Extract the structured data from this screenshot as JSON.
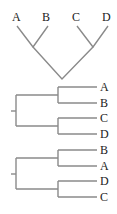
{
  "header_fragment": "图 1 数据",
  "trees": [
    {
      "id": "tree-v",
      "orientation": "vertical",
      "leaves": [
        "A",
        "B",
        "C",
        "D"
      ],
      "topology": "((A,B),(C,D))"
    },
    {
      "id": "tree-h1",
      "orientation": "horizontal",
      "leaves": [
        "A",
        "B",
        "C",
        "D"
      ],
      "topology": "((A,B),(C,D))"
    },
    {
      "id": "tree-h2",
      "orientation": "horizontal",
      "leaves": [
        "B",
        "A",
        "D",
        "C"
      ],
      "topology": "((B,A),(D,C))"
    }
  ],
  "colors": {
    "line": "#8a8a8a",
    "label": "#222222"
  }
}
